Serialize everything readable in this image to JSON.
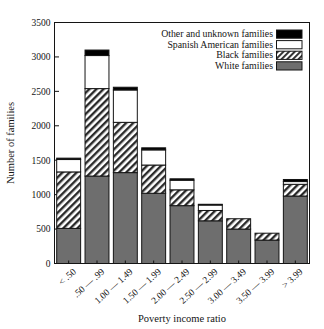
{
  "chart_data": {
    "type": "bar",
    "subtype": "stacked-vertical",
    "title": "",
    "xlabel": "Poverty income ratio",
    "ylabel": "Number of families",
    "ylim": [
      0,
      3500
    ],
    "yticks": [
      0,
      500,
      1000,
      1500,
      2000,
      2500,
      3000,
      3500
    ],
    "ytick_labels": [
      "0",
      "500",
      "1000",
      "1500",
      "2000",
      "2500",
      "3000",
      "3500"
    ],
    "grid": false,
    "legend_position": "top-right-inside",
    "categories": [
      "< .50",
      ".50 — .99",
      "1.00 — 1.49",
      "1.50 — 1.99",
      "2.00 — 2.49",
      "2.50 — 2.99",
      "3.00 — 3.49",
      "3.50 — 3.99",
      "> 3.99"
    ],
    "series": [
      {
        "name": "White families",
        "fill": "gray",
        "color": "#6e6e6e",
        "values": [
          510,
          1270,
          1320,
          1020,
          840,
          620,
          500,
          340,
          980
        ]
      },
      {
        "name": "Black families",
        "fill": "hatch",
        "color": "#ffffff",
        "values": [
          820,
          1270,
          730,
          410,
          230,
          150,
          150,
          100,
          170
        ]
      },
      {
        "name": "Spanish American families",
        "fill": "white",
        "color": "#ffffff",
        "values": [
          180,
          480,
          470,
          220,
          140,
          80,
          0,
          0,
          40
        ]
      },
      {
        "name": "Other and unknown families",
        "fill": "black",
        "color": "#000000",
        "values": [
          20,
          80,
          40,
          30,
          20,
          10,
          0,
          0,
          30
        ]
      }
    ],
    "totals": [
      1530,
      3100,
      2560,
      1680,
      1230,
      860,
      650,
      440,
      1220
    ]
  },
  "legend": {
    "entries": [
      {
        "label": "Other and unknown families",
        "swatch": "black"
      },
      {
        "label": "Spanish American families",
        "swatch": "white"
      },
      {
        "label": "Black families",
        "swatch": "hatch"
      },
      {
        "label": "White families",
        "swatch": "gray"
      }
    ]
  },
  "colors": {
    "gray": "#6e6e6e",
    "black": "#000000",
    "white": "#ffffff",
    "axis": "#141414"
  }
}
